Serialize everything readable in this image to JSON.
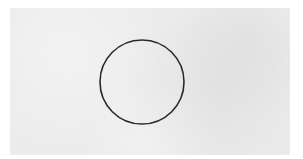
{
  "scene": {
    "description": "Hand-drawn circle outline on light gray textured paper",
    "background_color": "#ececec",
    "border_color": "#ffffff",
    "shape": {
      "type": "circle",
      "cx": 142,
      "cy": 82,
      "r": 42,
      "stroke_color": "#2a2a2a",
      "stroke_width": 1.6,
      "fill": "none"
    }
  }
}
